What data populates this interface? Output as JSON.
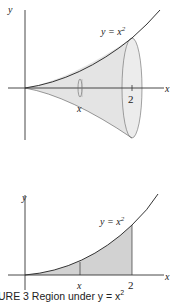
{
  "top_figure": {
    "axis_x_label": "x",
    "axis_y_label": "y",
    "curve_label": "y = x",
    "curve_exponent": "2",
    "slice_label": "x",
    "tick_label": "2"
  },
  "bottom_figure": {
    "axis_x_label": "x",
    "axis_y_label": "y",
    "curve_label": "y = x",
    "curve_exponent": "2",
    "slice_label": "x",
    "tick_label": "2"
  },
  "caption": "URE 3  Region under y = x",
  "caption_exponent": "2",
  "colors": {
    "fill": "#d9d9d9",
    "solid_fill": "#c8c8c8",
    "line": "#333333"
  }
}
